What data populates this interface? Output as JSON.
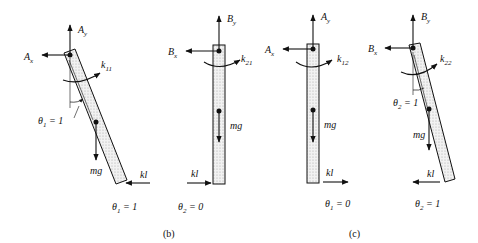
{
  "figure": {
    "captions": {
      "b": "(b)",
      "c": "(c)"
    },
    "panels": [
      {
        "id": "b1",
        "forces": {
          "vertical": "A",
          "vertical_sub": "y",
          "horizontal": "A",
          "horizontal_sub": "x"
        },
        "moment": "k",
        "moment_sub": "11",
        "angle_label": "θ",
        "angle_sub": "1",
        "angle_value": " = 1",
        "weight": "mg",
        "spring": "kl",
        "state": "θ",
        "state_sub": "1",
        "state_value": " = 1"
      },
      {
        "id": "b2",
        "forces": {
          "vertical": "B",
          "vertical_sub": "y",
          "horizontal": "B",
          "horizontal_sub": "x"
        },
        "moment": "k",
        "moment_sub": "21",
        "weight": "mg",
        "spring": "kl",
        "state": "θ",
        "state_sub": "2",
        "state_value": " = 0"
      },
      {
        "id": "c1",
        "forces": {
          "vertical": "A",
          "vertical_sub": "y",
          "horizontal": "A",
          "horizontal_sub": "x"
        },
        "moment": "k",
        "moment_sub": "12",
        "weight": "mg",
        "spring": "kl",
        "state": "θ",
        "state_sub": "1",
        "state_value": " = 0"
      },
      {
        "id": "c2",
        "forces": {
          "vertical": "B",
          "vertical_sub": "y",
          "horizontal": "B",
          "horizontal_sub": "x"
        },
        "moment": "k",
        "moment_sub": "22",
        "angle_label": "θ",
        "angle_sub": "2",
        "angle_value": " = 1",
        "weight": "mg",
        "spring": "kl",
        "state": "θ",
        "state_sub": "2",
        "state_value": " = 1"
      }
    ],
    "colors": {
      "ink": "#111111",
      "fill": "#e6e6e6",
      "background": "#ffffff"
    }
  }
}
